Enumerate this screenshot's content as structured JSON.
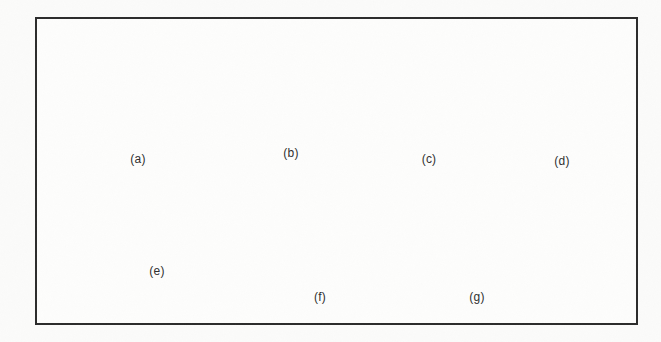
{
  "figure": {
    "background_color": "#fbfbfa",
    "frame_color": "#2b2b2b",
    "caption_color": "#2e2e2e"
  },
  "palette": {
    "dark_face": "#6d6d6d",
    "mid_face": "#8f8f8f",
    "light_face": "#b9b9b9",
    "lighter_face": "#c9c9c9",
    "outline": "#3a3a3a",
    "shadow": "#4a4a4a",
    "highlight": "#d8d8d8"
  },
  "shapes": [
    {
      "id": "cube",
      "label": "(a)",
      "name": "cube",
      "label_x": 138,
      "label_y": 158,
      "faces": [
        "top",
        "left",
        "right"
      ]
    },
    {
      "id": "sphere",
      "label": "(b)",
      "name": "sphere",
      "label_x": 291,
      "label_y": 152,
      "faces": [
        "surface"
      ]
    },
    {
      "id": "cylinder",
      "label": "(c)",
      "name": "cylinder",
      "label_x": 429,
      "label_y": 158,
      "faces": [
        "top-ellipse",
        "body"
      ]
    },
    {
      "id": "cone",
      "label": "(d)",
      "name": "cone",
      "label_x": 562,
      "label_y": 160,
      "faces": [
        "lateral",
        "base-arc"
      ]
    },
    {
      "id": "torus",
      "label": "(e)",
      "name": "torus",
      "label_x": 157,
      "label_y": 270,
      "faces": [
        "ring",
        "hole"
      ]
    },
    {
      "id": "wedge",
      "label": "(f)",
      "name": "wedge",
      "label_x": 320,
      "label_y": 296,
      "faces": [
        "slant-top",
        "right-triangle",
        "front"
      ]
    },
    {
      "id": "pyramid",
      "label": "(g)",
      "name": "pyramid",
      "label_x": 477,
      "label_y": 296,
      "faces": [
        "left-face",
        "right-face"
      ]
    }
  ]
}
